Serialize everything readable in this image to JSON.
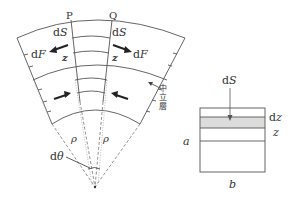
{
  "figure": {
    "type": "beam-bending-diagram",
    "left_panel": {
      "description": "Sector of a bent beam element between cross-sections P and Q, converging to a centre of curvature",
      "section_labels": {
        "left": "P",
        "right": "Q"
      },
      "arc_length_label_left": "dS",
      "arc_length_label_right": "dS",
      "force_label_left": "dF",
      "force_label_right": "dF",
      "distance_label_left": "z",
      "distance_label_right": "z",
      "radius_label_left": "ρ",
      "radius_label_right": "ρ",
      "angle_label": "dθ",
      "neutral_layer_label": [
        "中",
        "立",
        "層"
      ],
      "arrows": {
        "upper": "tension (arrows point outward)",
        "lower": "compression (arrows point inward)"
      }
    },
    "right_panel": {
      "description": "Rectangular cross-section with a shaded strip of thickness dz at distance z",
      "area_label": "dS",
      "strip_thickness_label": "dz",
      "distance_label": "z",
      "height_label": "a",
      "width_label": "b"
    },
    "colors": {
      "line": "#555555",
      "arrow": "#222222",
      "shaded_strip": "#dcdcdc",
      "text": "#333333"
    }
  }
}
